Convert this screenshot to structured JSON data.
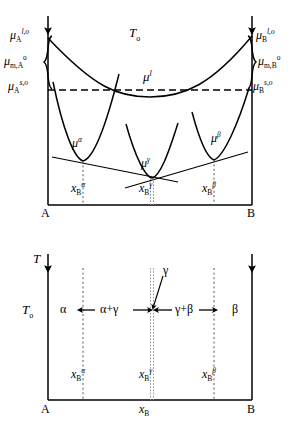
{
  "figure": {
    "type": "thermodynamic-free-energy-and-phase-diagram",
    "panels": [
      "chemical-potential-vs-composition",
      "isothermal-phase-region-bar"
    ]
  },
  "upper_panel": {
    "temperature_label": "T",
    "temperature_sub": "o",
    "liquid_curve_label": "μ",
    "liquid_curve_sup": "l",
    "left_axis": {
      "top_label_base": "μ",
      "top_label_sub": "A",
      "top_label_sup": "l,o",
      "brace_label_base": "μ",
      "brace_label_sub": "m,A",
      "brace_label_sup": "o",
      "bottom_label_base": "μ",
      "bottom_label_sub": "A",
      "bottom_label_sup": "s,o"
    },
    "right_axis": {
      "top_label_base": "μ",
      "top_label_sub": "B",
      "top_label_sup": "l,o",
      "brace_label_base": "μ",
      "brace_label_sub": "m,B",
      "brace_label_sup": "o",
      "bottom_label_base": "μ",
      "bottom_label_sub": "B",
      "bottom_label_sup": "s,o"
    },
    "phase_curves": [
      {
        "name": "alpha",
        "label_base": "μ",
        "label_sup": "α"
      },
      {
        "name": "gamma",
        "label_base": "μ",
        "label_sup": "γ"
      },
      {
        "name": "beta",
        "label_base": "μ",
        "label_sup": "β"
      }
    ],
    "composition_ticks": [
      {
        "base": "x",
        "sub": "B",
        "sup": "α"
      },
      {
        "base": "x",
        "sub": "B",
        "sup": "γ"
      },
      {
        "base": "x",
        "sub": "B",
        "sup": "β"
      }
    ],
    "axis_end_left": "A",
    "axis_end_right": "B"
  },
  "lower_panel": {
    "y_axis_label": "T",
    "temperature_label": "T",
    "temperature_sub": "o",
    "regions": [
      {
        "name": "alpha",
        "label": "α"
      },
      {
        "name": "alpha-plus-gamma",
        "label": "α+γ"
      },
      {
        "name": "gamma-plus-beta",
        "label": "γ+β"
      },
      {
        "name": "beta",
        "label": "β"
      }
    ],
    "pointer_label": "γ",
    "composition_ticks": [
      {
        "base": "x",
        "sub": "B",
        "sup": "α"
      },
      {
        "base": "x",
        "sub": "B",
        "sup": "γ"
      },
      {
        "base": "x",
        "sub": "B",
        "sup": "β"
      }
    ],
    "x_axis_label_base": "x",
    "x_axis_label_sub": "B",
    "axis_end_left": "A",
    "axis_end_right": "B"
  },
  "colors": {
    "line": "#000000",
    "dotted_guide": "#555555",
    "background": "#ffffff"
  }
}
